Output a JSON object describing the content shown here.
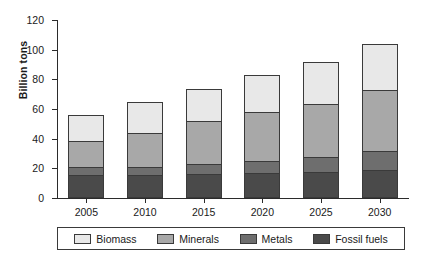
{
  "chart_data": {
    "type": "bar",
    "stacked": true,
    "title": "",
    "xlabel": "",
    "ylabel": "Billion tons",
    "ylim": [
      0,
      120
    ],
    "yticks": [
      0,
      20,
      40,
      60,
      80,
      100,
      120
    ],
    "grid": false,
    "legend_position": "bottom",
    "categories": [
      "2005",
      "2010",
      "2015",
      "2020",
      "2025",
      "2030"
    ],
    "series": [
      {
        "name": "Fossil fuels",
        "color": "#4a4a4a",
        "values": [
          15,
          15,
          15.5,
          16,
          17,
          18
        ]
      },
      {
        "name": "Metals",
        "color": "#6e6e6e",
        "values": [
          5,
          5,
          6.5,
          8,
          10,
          13
        ]
      },
      {
        "name": "Minerals",
        "color": "#a8a8a8",
        "values": [
          18,
          23,
          29,
          33,
          36,
          41
        ]
      },
      {
        "name": "Biomass",
        "color": "#e8e8e8",
        "values": [
          17,
          21,
          22,
          25,
          28,
          31
        ]
      }
    ],
    "totals": [
      55,
      64,
      73,
      82,
      91,
      103
    ]
  },
  "legend": {
    "items": [
      {
        "label": "Biomass",
        "color": "#e8e8e8"
      },
      {
        "label": "Minerals",
        "color": "#a8a8a8"
      },
      {
        "label": "Metals",
        "color": "#6e6e6e"
      },
      {
        "label": "Fossil fuels",
        "color": "#4a4a4a"
      }
    ]
  }
}
